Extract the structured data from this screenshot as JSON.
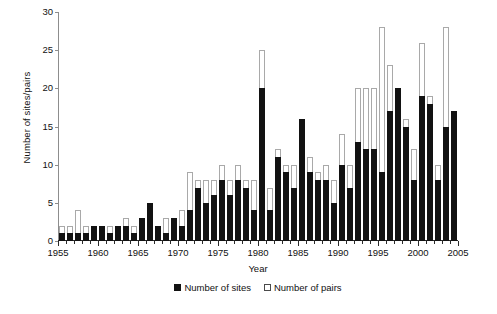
{
  "chart_data": {
    "type": "bar",
    "title": "",
    "subtitle": "",
    "xlabel": "Year",
    "ylabel": "Number of sites/pairs",
    "xlim": [
      1955,
      2005
    ],
    "ylim": [
      0,
      30
    ],
    "ytick_step": 5,
    "yticks": [
      0,
      5,
      10,
      15,
      20,
      25,
      30
    ],
    "xticks_major": [
      1955,
      1960,
      1965,
      1970,
      1975,
      1980,
      1985,
      1990,
      1995,
      2000,
      2005
    ],
    "xtick_labels": [
      "1955",
      "1960",
      "1965",
      "1970",
      "1975",
      "1980",
      "1985",
      "1990",
      "1995",
      "2000",
      "2005"
    ],
    "grid": false,
    "stacked_overlay": true,
    "legend_position": "bottom-center",
    "legend": [
      {
        "name": "Number of sites",
        "style": "filled",
        "color": "#121212"
      },
      {
        "name": "Number of pairs",
        "style": "hollow",
        "color": "#ffffff"
      }
    ],
    "categories": [
      1955,
      1956,
      1957,
      1958,
      1959,
      1960,
      1961,
      1962,
      1963,
      1964,
      1965,
      1966,
      1967,
      1968,
      1969,
      1970,
      1971,
      1972,
      1973,
      1974,
      1975,
      1976,
      1977,
      1978,
      1979,
      1980,
      1981,
      1982,
      1983,
      1984,
      1985,
      1986,
      1987,
      1988,
      1989,
      1990,
      1991,
      1992,
      1993,
      1994,
      1995,
      1996,
      1997,
      1998,
      1999,
      2000,
      2001,
      2002,
      2003,
      2004
    ],
    "series": [
      {
        "name": "Number of sites",
        "color": "#121212",
        "values": [
          1,
          1,
          1,
          1,
          2,
          2,
          1,
          2,
          2,
          1,
          3,
          5,
          2,
          1,
          3,
          2,
          4,
          7,
          5,
          6,
          8,
          6,
          8,
          7,
          4,
          20,
          4,
          11,
          9,
          7,
          16,
          9,
          8,
          8,
          5,
          10,
          7,
          13,
          12,
          12,
          9,
          17,
          20,
          15,
          8,
          19,
          18,
          8,
          15,
          17
        ]
      },
      {
        "name": "Number of pairs",
        "color": "#ffffff",
        "values": [
          2,
          2,
          4,
          2,
          2,
          2,
          2,
          2,
          3,
          2,
          3,
          5,
          2,
          3,
          3,
          4,
          9,
          8,
          8,
          8,
          10,
          8,
          10,
          8,
          8,
          25,
          7,
          12,
          10,
          10,
          16,
          11,
          9,
          10,
          8,
          14,
          10,
          20,
          20,
          20,
          28,
          23,
          20,
          16,
          12,
          26,
          19,
          10,
          28,
          17
        ]
      }
    ]
  }
}
